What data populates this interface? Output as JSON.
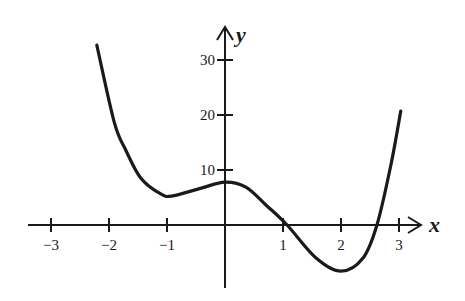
{
  "chart_data": {
    "type": "line",
    "title": "",
    "xlabel": "x",
    "ylabel": "y",
    "xlim": [
      -3.4,
      3.4
    ],
    "ylim": [
      -9,
      35
    ],
    "grid": false,
    "legend": null,
    "x_ticks": [
      -3,
      -2,
      -1,
      1,
      2,
      3
    ],
    "x_tick_labels": [
      "−3",
      "−2",
      "−1",
      "1",
      "2",
      "3"
    ],
    "y_ticks": [
      10,
      20,
      30
    ],
    "y_tick_labels": [
      "10",
      "20",
      "30"
    ],
    "series": [
      {
        "name": "f(x)",
        "x": [
          -2.21,
          -1.91,
          -1.71,
          -1.45,
          -1.1,
          -0.9,
          -0.41,
          0.0,
          0.36,
          0.71,
          1.07,
          1.57,
          2.0,
          2.38,
          2.62,
          2.86,
          3.03
        ],
        "y": [
          32.7,
          18.7,
          13.6,
          8.5,
          5.6,
          5.3,
          6.7,
          7.8,
          6.9,
          3.6,
          0.0,
          -6.0,
          -8.4,
          -6.0,
          0.0,
          10.9,
          20.7
        ]
      }
    ],
    "annotations": {
      "local_min_1": {
        "x": -0.9,
        "y": 5.3
      },
      "local_max": {
        "x": 0,
        "y": 7.8
      },
      "local_min_2": {
        "x": 2.0,
        "y": -8.4
      },
      "x_intercepts": [
        1.07,
        2.62
      ],
      "y_intercept": 7.8
    }
  },
  "axes": {
    "x_label": "x",
    "y_label": "y"
  }
}
